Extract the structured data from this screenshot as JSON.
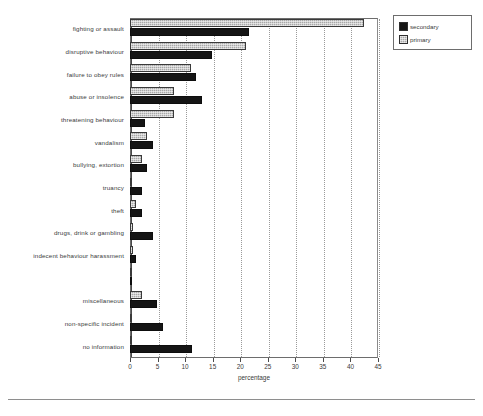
{
  "chart_data": {
    "type": "bar",
    "orientation": "horizontal",
    "title": "",
    "xlabel": "percentage",
    "ylabel": "",
    "xlim": [
      0,
      45
    ],
    "xticks": [
      0,
      5,
      10,
      15,
      20,
      25,
      30,
      35,
      40,
      45
    ],
    "grid": "vertical-dotted",
    "legend_position": "top-right",
    "categories": [
      "fighting or assault",
      "disruptive behaviour",
      "failure to obey rules",
      "abuse or insolence",
      "threatening behaviour",
      "vandalism",
      "bullying, extortion",
      "truancy",
      "theft",
      "drugs, drink or gambling",
      "indecent behaviour harassment",
      "",
      "miscellaneous",
      "non-specific incident",
      "no information"
    ],
    "series": [
      {
        "name": "primary",
        "color": "#a8a8a8",
        "values": [
          42.5,
          21.0,
          11.0,
          8.0,
          8.0,
          3.0,
          2.2,
          0.2,
          1.0,
          0.5,
          0.5,
          0.1,
          2.2,
          0.1,
          0.2
        ]
      },
      {
        "name": "secondary",
        "color": "#151515",
        "values": [
          21.6,
          14.8,
          12.0,
          13.0,
          2.8,
          4.1,
          3.0,
          2.1,
          2.1,
          4.2,
          1.0,
          0.0,
          4.9,
          6.0,
          11.2
        ]
      }
    ]
  },
  "legend": {
    "items": [
      {
        "label": "secondary",
        "swatch": "secondary-swatch-icon"
      },
      {
        "label": "primary",
        "swatch": "primary-swatch-icon"
      }
    ]
  },
  "axis": {
    "x_title": "percentage",
    "tick_labels": [
      "0",
      "5",
      "10",
      "15",
      "20",
      "25",
      "30",
      "35",
      "40",
      "45"
    ]
  }
}
